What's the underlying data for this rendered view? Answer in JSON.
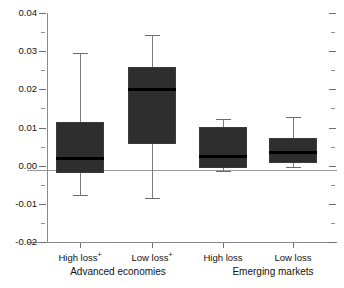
{
  "chart_data": {
    "type": "box",
    "title": "",
    "xlabel": "",
    "ylabel": "",
    "ylim": [
      -0.02,
      0.04
    ],
    "grid": false,
    "legend": "none",
    "zero_reference_line": 0.0,
    "y_ticks_major": [
      0.04,
      0.03,
      0.02,
      0.01,
      0.0,
      -0.01,
      -0.02
    ],
    "y_tick_labels": [
      "0.04",
      "0.03",
      "0.02",
      "0.01",
      "0.00",
      "-0.01",
      "-0.02"
    ],
    "y_ticks_minor": [
      0.035,
      0.025,
      0.015,
      0.005,
      -0.005,
      -0.015
    ],
    "categories": [
      "High loss+",
      "Low loss+",
      "High loss",
      "Low loss"
    ],
    "groups": [
      {
        "label": "Advanced economies",
        "categories": [
          "High loss+",
          "Low loss+"
        ]
      },
      {
        "label": "Emerging markets",
        "categories": [
          "High loss",
          "Low loss"
        ]
      }
    ],
    "boxes": [
      {
        "category": "High loss+",
        "group": "Advanced economies",
        "footnote_marker": "+",
        "whisker_high": 0.0295,
        "q3": 0.0115,
        "median": 0.0021,
        "q1": -0.002,
        "whisker_low": -0.0078
      },
      {
        "category": "Low loss+",
        "group": "Advanced economies",
        "footnote_marker": "+",
        "whisker_high": 0.0343,
        "q3": 0.0258,
        "median": 0.02,
        "q1": 0.0058,
        "whisker_low": -0.0086
      },
      {
        "category": "High loss",
        "group": "Emerging markets",
        "footnote_marker": "",
        "whisker_high": 0.0122,
        "q3": 0.0101,
        "median": 0.0025,
        "q1": -0.0005,
        "whisker_low": -0.0015
      },
      {
        "category": "Low loss",
        "group": "Emerging markets",
        "footnote_marker": "",
        "whisker_high": 0.0128,
        "q3": 0.0073,
        "median": 0.0037,
        "q1": 0.0008,
        "whisker_low": -0.0003
      }
    ],
    "colors": {
      "box_fill": "#2e2e2e",
      "median": "#000000",
      "whisker": "#7d7d7d",
      "axis": "#8a8a8a",
      "zero_line": "#9a9a9a",
      "text": "#111111",
      "background": "#ffffff"
    }
  },
  "axis_labels": {
    "y": [
      "0.04",
      "0.03",
      "0.02",
      "0.01",
      "0.00",
      "-0.01",
      "-0.02"
    ],
    "categories": [
      "High loss",
      "Low loss",
      "High loss",
      "Low loss"
    ],
    "markers": [
      "+",
      "+",
      "",
      ""
    ],
    "groups": [
      "Advanced economies",
      "Emerging markets"
    ]
  }
}
